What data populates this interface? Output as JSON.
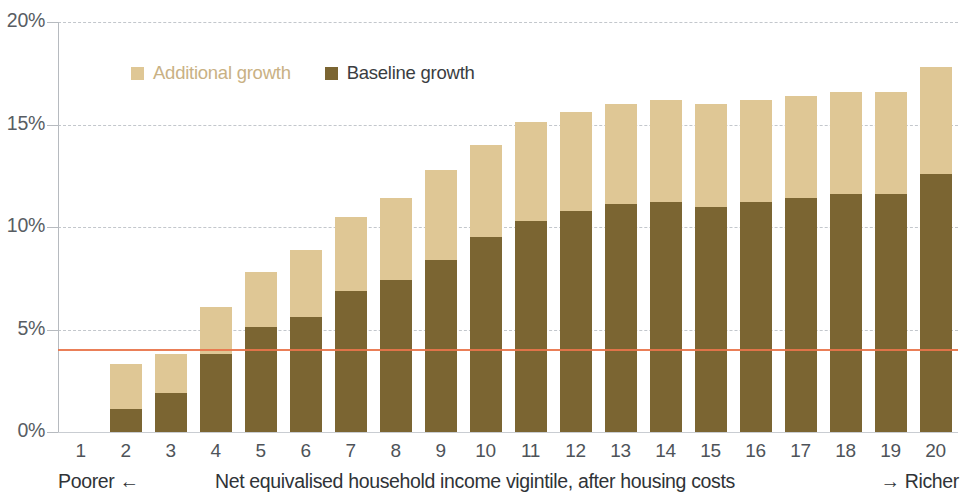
{
  "colors": {
    "baseline": "#7b6532",
    "additional": "#dfc795",
    "reference_line": "#e8744a",
    "grid": "#b9bec4",
    "axis": "#b6babf",
    "tick_text": "#4e5359",
    "legend_additional_text": "#c9b184",
    "legend_baseline_text": "#3a3d41"
  },
  "legend": {
    "items": [
      {
        "label": "Additional growth",
        "swatch": "#dfc795",
        "text_color": "#c9b184"
      },
      {
        "label": "Baseline growth",
        "swatch": "#7b6532",
        "text_color": "#3a3d41"
      }
    ]
  },
  "axes": {
    "y": {
      "ticks": [
        "0%",
        "5%",
        "10%",
        "15%",
        "20%"
      ],
      "values": [
        0,
        5,
        10,
        15,
        20
      ],
      "min": 0,
      "max": 20
    },
    "x": {
      "caption_left": "Poorer ←",
      "caption_main": "Net equivalised household income vigintile, after housing costs",
      "caption_right": "→ Richer",
      "ticks": [
        "1",
        "2",
        "3",
        "4",
        "5",
        "6",
        "7",
        "8",
        "9",
        "10",
        "11",
        "12",
        "13",
        "14",
        "15",
        "16",
        "17",
        "18",
        "19",
        "20"
      ]
    }
  },
  "reference_line": {
    "value": 4.05,
    "label": ""
  },
  "chart_data": {
    "type": "bar",
    "stacked": true,
    "title": "",
    "subtitle": "",
    "xlabel": "Net equivalised household income vigintile, after housing costs",
    "ylabel": "",
    "ylim": [
      0,
      20
    ],
    "yunit": "%",
    "grid": true,
    "legend_position": "top-left-inside",
    "categories": [
      "1",
      "2",
      "3",
      "4",
      "5",
      "6",
      "7",
      "8",
      "9",
      "10",
      "11",
      "12",
      "13",
      "14",
      "15",
      "16",
      "17",
      "18",
      "19",
      "20"
    ],
    "series": [
      {
        "name": "Baseline growth",
        "color": "#7b6532",
        "values": [
          0.0,
          1.1,
          1.9,
          3.8,
          5.1,
          5.6,
          6.9,
          7.4,
          8.4,
          9.5,
          10.3,
          10.8,
          11.1,
          11.2,
          11.0,
          11.2,
          11.4,
          11.6,
          11.6,
          12.6
        ]
      },
      {
        "name": "Additional growth",
        "color": "#dfc795",
        "values": [
          0.0,
          2.2,
          1.9,
          2.3,
          2.7,
          3.3,
          3.6,
          4.0,
          4.4,
          4.5,
          4.8,
          4.8,
          4.9,
          5.0,
          5.0,
          5.0,
          5.0,
          5.0,
          5.0,
          5.2
        ]
      }
    ],
    "totals": [
      0.0,
      3.3,
      3.8,
      6.1,
      7.8,
      8.9,
      10.5,
      11.4,
      12.8,
      14.0,
      15.1,
      15.6,
      16.0,
      16.2,
      16.0,
      16.2,
      16.4,
      16.6,
      16.6,
      17.8
    ],
    "reference_line_value": 4.05,
    "annotations": [
      "Poorer ←",
      "→ Richer"
    ]
  }
}
